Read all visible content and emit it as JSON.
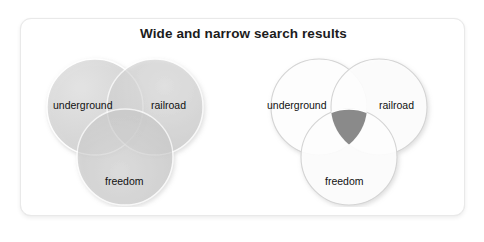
{
  "card": {
    "title": "Wide and narrow search results",
    "background": "#ffffff",
    "border_color": "#e9e9e9"
  },
  "diagrams": [
    {
      "id": "wide",
      "name": "wide-search-venn",
      "style": "filled",
      "description": "Three heavily shaded overlapping circles representing a wide search where all terms return many results",
      "circles": [
        {
          "term": "underground",
          "fill": "#d9d9d9",
          "label_x": 24,
          "label_y": 58
        },
        {
          "term": "railroad",
          "fill": "#cfcfcf",
          "label_x": 120,
          "label_y": 58
        },
        {
          "term": "freedom",
          "fill": "#c9c9c9",
          "label_x": 76,
          "label_y": 134
        }
      ]
    },
    {
      "id": "narrow",
      "name": "narrow-search-venn",
      "style": "outline",
      "description": "Three outlined circles with only the central three-way intersection shaded, representing a narrow search",
      "circles": [
        {
          "term": "underground",
          "fill": "#ffffff",
          "label_x": 18,
          "label_y": 58
        },
        {
          "term": "railroad",
          "fill": "#ffffff",
          "label_x": 128,
          "label_y": 58
        },
        {
          "term": "freedom",
          "fill": "#ffffff",
          "label_x": 72,
          "label_y": 134
        }
      ],
      "intersection_fill": "#8a8a8a"
    }
  ],
  "colors": {
    "title_text": "#1c1c1c",
    "label_text": "#111111",
    "circle_outline": "#cfcfcf",
    "page_background": "#ffffff",
    "intersection_dark": "#8a8a8a"
  }
}
